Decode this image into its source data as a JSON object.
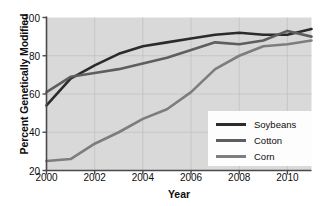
{
  "chart_data": {
    "type": "line",
    "title": "",
    "xlabel": "Year",
    "ylabel": "Percent Genetically Modified",
    "xlim": [
      2000,
      2011
    ],
    "ylim": [
      20,
      100
    ],
    "xticks": [
      "2000",
      "2002",
      "2004",
      "2006",
      "2008",
      "2010"
    ],
    "xtick_values": [
      2000,
      2002,
      2004,
      2006,
      2008,
      2010
    ],
    "yticks": [
      "20",
      "40",
      "60",
      "80",
      "100"
    ],
    "ytick_values": [
      20,
      40,
      60,
      80,
      100
    ],
    "grid": true,
    "legend_position": "lower right",
    "x": [
      2000,
      2001,
      2002,
      2003,
      2004,
      2005,
      2006,
      2007,
      2008,
      2009,
      2010,
      2011
    ],
    "series": [
      {
        "name": "Soybeans",
        "color": "#2b2b2b",
        "values": [
          54,
          68,
          75,
          81,
          85,
          87,
          89,
          91,
          92,
          91,
          91,
          94
        ]
      },
      {
        "name": "Cotton",
        "color": "#5e5e5e",
        "values": [
          61,
          69,
          71,
          73,
          76,
          79,
          83,
          87,
          86,
          88,
          93,
          90
        ]
      },
      {
        "name": "Corn",
        "color": "#7d7d7d",
        "values": [
          25,
          26,
          34,
          40,
          47,
          52,
          61,
          73,
          80,
          85,
          86,
          88
        ]
      }
    ]
  },
  "axes": {
    "background_color": "#d9d9d9",
    "frame_color": "#4a4a4a",
    "grid_color": "#c2c2c2"
  },
  "legend": {
    "entries": [
      {
        "label": "Soybeans",
        "color": "#2b2b2b"
      },
      {
        "label": "Cotton",
        "color": "#5e5e5e"
      },
      {
        "label": "Corn",
        "color": "#7d7d7d"
      }
    ]
  }
}
